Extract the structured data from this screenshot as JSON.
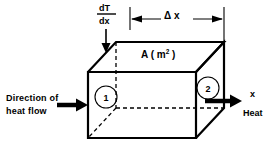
{
  "figure": {
    "background_color": "#ffffff",
    "ink_color": "#000000",
    "width": 277,
    "height": 153
  },
  "labels": {
    "gradient_numerator": "dT",
    "gradient_denominator": "dx",
    "thickness": "Δ x",
    "area_symbol": "A ( m",
    "area_superscript": "2",
    "area_close": " )",
    "face_one": "1",
    "face_two": "2",
    "direction_line1": "Direction of",
    "direction_line2": "heat flow",
    "axis_x": "x",
    "heat_out": "Heat"
  },
  "icons": {
    "gradient_arrow": "arrow-down-icon",
    "heat_in_arrow": "arrow-right-thick-icon",
    "heat_out_arrow": "arrow-right-thick-icon",
    "dimension_arrow_left": "arrow-left-icon",
    "dimension_arrow_right": "arrow-right-icon"
  },
  "geometry": {
    "front_face": {
      "top_left": [
        88,
        72
      ],
      "top_right": [
        196,
        72
      ],
      "bottom_right": [
        196,
        138
      ],
      "bottom_left": [
        88,
        138
      ]
    },
    "depth_offset": [
      28,
      -30
    ],
    "hidden_edges": "dashed",
    "visible_edges": "solid"
  }
}
